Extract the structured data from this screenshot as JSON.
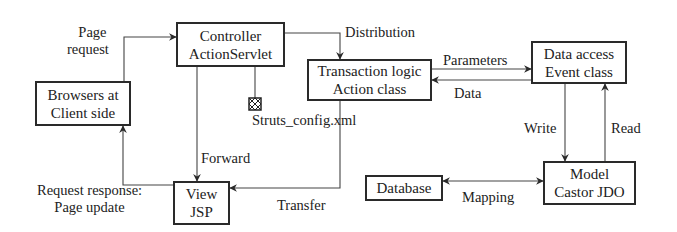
{
  "nodes": {
    "browser": {
      "line1": "Browsers at",
      "line2": "Client side"
    },
    "controller": {
      "line1": "Controller",
      "line2": "ActionServlet"
    },
    "transaction": {
      "line1": "Transaction logic",
      "line2": "Action class"
    },
    "data_access": {
      "line1": "Data access",
      "line2": "Event class"
    },
    "model": {
      "line1": "Model",
      "line2": "Castor JDO"
    },
    "database": {
      "line1": "Database"
    },
    "view": {
      "line1": "View",
      "line2": "JSP"
    },
    "config": {
      "label": "Struts_config.xml",
      "icon": "xml-config-file-icon"
    }
  },
  "edges": {
    "page_request": {
      "line1": "Page",
      "line2": "request"
    },
    "distribution": "Distribution",
    "parameters": "Parameters",
    "data": "Data",
    "write": "Write",
    "read": "Read",
    "mapping": "Mapping",
    "forward": "Forward",
    "transfer": "Transfer",
    "response": {
      "line1": "Request response:",
      "line2": "Page update"
    }
  }
}
